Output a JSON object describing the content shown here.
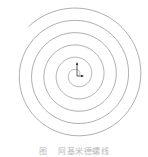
{
  "figure": {
    "type": "archimedean-spiral",
    "center": [
      77,
      75
    ],
    "pitch_px_per_turn": 12.3,
    "turns": 5.4,
    "end_angle_deg": 135,
    "stroke_color": "#8a8a8a",
    "stroke_width": 0.7,
    "axis_marker": {
      "origin": [
        77,
        76
      ],
      "y_axis_end": [
        77,
        63
      ],
      "x_axis_end": [
        83,
        76
      ],
      "color": "#333333"
    }
  },
  "caption": {
    "label": "图",
    "title": "阿基米德螺线"
  }
}
